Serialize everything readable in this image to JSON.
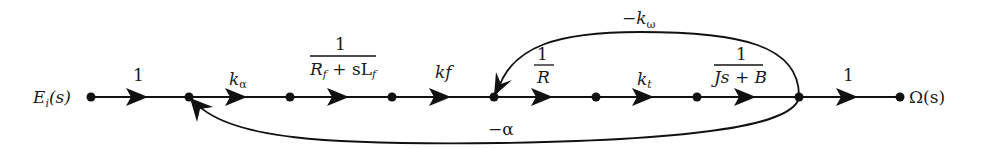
{
  "diagram": {
    "type": "signal-flow-graph",
    "input_label": "E",
    "input_sub": "i",
    "input_arg": "(s)",
    "output_label": "Ω(s)",
    "branches": [
      {
        "from": 0,
        "to": 1,
        "gain": "1"
      },
      {
        "from": 1,
        "to": 2,
        "gain_main": "k",
        "gain_sub": "α"
      },
      {
        "from": 2,
        "to": 3,
        "num": "1",
        "den": "R_f + sL_f"
      },
      {
        "from": 3,
        "to": 4,
        "gain": "kf"
      },
      {
        "from": 4,
        "to": 5,
        "num": "1",
        "den": "R"
      },
      {
        "from": 5,
        "to": 6,
        "gain_main": "k",
        "gain_sub": "t"
      },
      {
        "from": 6,
        "to": 7,
        "num": "1",
        "den": "Js + B"
      },
      {
        "from": 7,
        "to": 8,
        "gain": "1"
      }
    ],
    "feedback": [
      {
        "from": 7,
        "to": 4,
        "gain_main": "−k",
        "gain_sub": "ω",
        "position": "above"
      },
      {
        "from": 7,
        "to": 1,
        "gain": "−α",
        "position": "below"
      }
    ],
    "labels": {
      "b0": "1",
      "b1_main": "k",
      "b1_sub": "α",
      "b2_num": "1",
      "b2_den_R": "R",
      "b2_den_f1": "f",
      "b2_den_mid": " + sL",
      "b2_den_f2": "f",
      "b3": "kf",
      "b4_num": "1",
      "b4_den": "R",
      "b5_main": "k",
      "b5_sub": "t",
      "b6_num": "1",
      "b6_den": "Js + B",
      "b7": "1",
      "fb_top_main": "−k",
      "fb_top_sub": "ω",
      "fb_bottom": "−α",
      "out": "Ω(s)"
    }
  }
}
